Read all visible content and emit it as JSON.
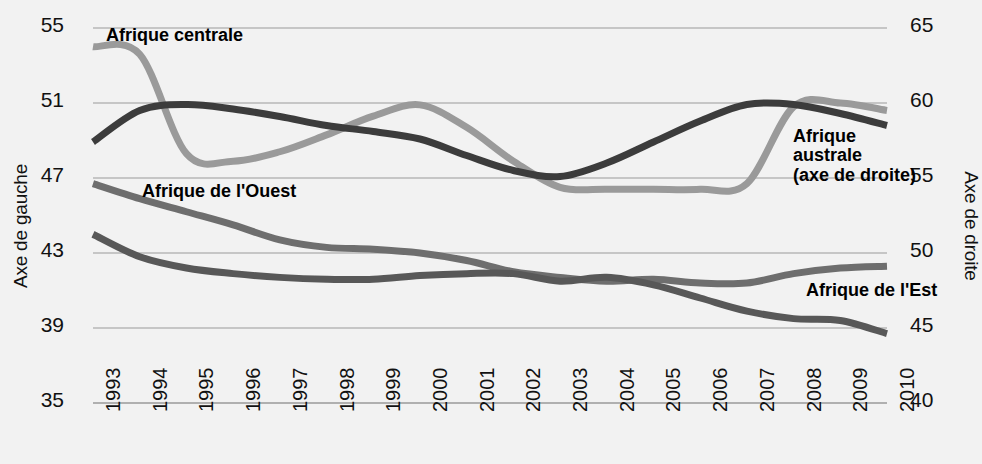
{
  "chart_data": {
    "type": "line",
    "title": "",
    "xlabel": "",
    "ylabel": "Axe de gauche",
    "y2label": "Axe de droite",
    "grid": true,
    "legend_position": "inline-labels",
    "x": [
      1993,
      1994,
      1995,
      1996,
      1997,
      1998,
      1999,
      2000,
      2001,
      2002,
      2003,
      2004,
      2005,
      2006,
      2007,
      2008,
      2009,
      2010
    ],
    "categories": [
      "1993",
      "1994",
      "1995",
      "1996",
      "1997",
      "1998",
      "1999",
      "2000",
      "2001",
      "2002",
      "2003",
      "2004",
      "2005",
      "2006",
      "2007",
      "2008",
      "2009",
      "2010"
    ],
    "ylim": [
      35,
      55
    ],
    "y2lim": [
      40,
      65
    ],
    "yticks": [
      "55",
      "51",
      "47",
      "43",
      "39",
      "35"
    ],
    "y2ticks": [
      "65",
      "60",
      "55",
      "50",
      "45",
      "40"
    ],
    "series": [
      {
        "name": "Afrique centrale",
        "axis": "left",
        "color": "#9a9a9a",
        "label_text": "Afrique centrale",
        "values": [
          54.0,
          53.6,
          48.3,
          47.9,
          48.4,
          49.3,
          50.3,
          50.9,
          49.7,
          47.9,
          46.5,
          46.4,
          46.4,
          46.4,
          46.7,
          50.8,
          51.0,
          50.6
        ]
      },
      {
        "name": "Afrique australe (axe de droite)",
        "axis": "right",
        "color": "#3c3c3c",
        "label_text": "Afrique\naustrale\n(axe de droite)",
        "label_lines": [
          "Afrique",
          "australe",
          "(axe de droite)"
        ],
        "values": [
          57.4,
          59.5,
          59.9,
          59.6,
          59.1,
          58.5,
          58.1,
          57.6,
          56.5,
          55.5,
          55.1,
          56.0,
          57.4,
          58.8,
          59.9,
          59.9,
          59.3,
          58.5
        ]
      },
      {
        "name": "Afrique de l'Ouest",
        "axis": "left",
        "color": "#6e6e6e",
        "label_text": "Afrique de l'Ouest",
        "values": [
          46.7,
          45.9,
          45.2,
          44.5,
          43.7,
          43.3,
          43.2,
          43.0,
          42.6,
          42.0,
          41.7,
          41.5,
          41.6,
          41.4,
          41.4,
          41.9,
          42.2,
          42.3
        ]
      },
      {
        "name": "Afrique de l'Est",
        "axis": "left",
        "color": "#585858",
        "label_text": "Afrique de l'Est",
        "values": [
          44.0,
          42.8,
          42.2,
          41.9,
          41.7,
          41.6,
          41.6,
          41.8,
          41.9,
          41.9,
          41.5,
          41.7,
          41.3,
          40.6,
          39.9,
          39.5,
          39.4,
          38.7
        ]
      }
    ]
  },
  "axes": {
    "left_title": "Axe de gauche",
    "right_title": "Axe de droite"
  },
  "labels": {
    "centrale": "Afrique centrale",
    "ouest": "Afrique de l'Ouest",
    "est": "Afrique de l'Est",
    "australe_line1": "Afrique",
    "australe_line2": "australe",
    "australe_line3": "(axe de droite)"
  }
}
